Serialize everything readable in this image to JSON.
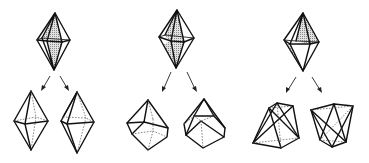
{
  "figure": {
    "columns": [
      {
        "id": "column-1",
        "source": "shaded-bipyramid",
        "results": [
          "bipyramid-with-hidden-equator",
          "twisted-bipyramid"
        ]
      },
      {
        "id": "column-2",
        "source": "shaded-bipyramid",
        "results": [
          "rhombic-cube-like-solid-a",
          "rhombic-cube-like-solid-b"
        ]
      },
      {
        "id": "column-3",
        "source": "shaded-bipyramid",
        "results": [
          "crossed-edge-polyhedron-a",
          "crossed-edge-polyhedron-b"
        ]
      }
    ],
    "colors": {
      "line": "#111111",
      "hidden_line": "#555555",
      "background": "#ffffff",
      "shade": "#bdbdbd"
    }
  }
}
